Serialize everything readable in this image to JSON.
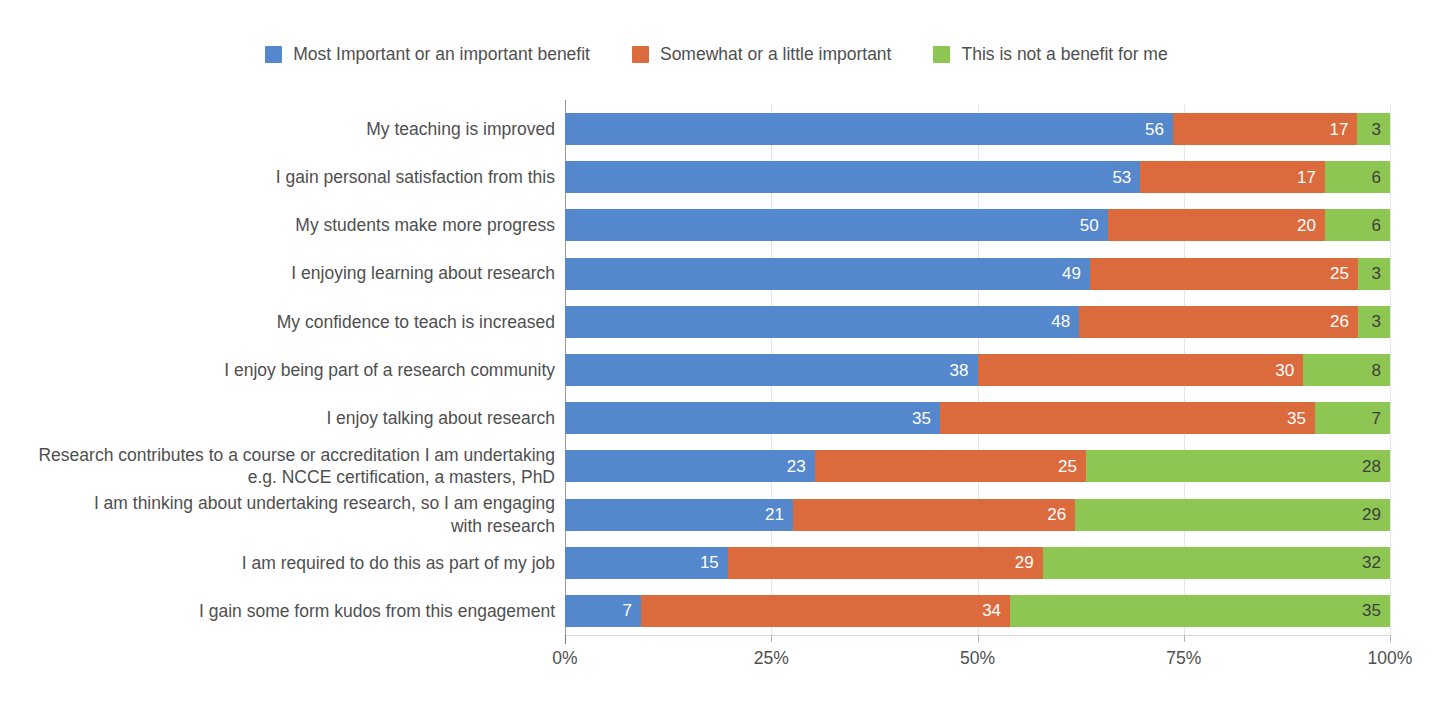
{
  "legend": {
    "position": "top-center",
    "items": [
      {
        "label": "Most Important or an important benefit",
        "color": "#5487CB",
        "key": "most_important"
      },
      {
        "label": "Somewhat or a little important",
        "color": "#DB6A3D",
        "key": "somewhat"
      },
      {
        "label": "This is not a benefit for me",
        "color": "#8DC653",
        "key": "not_a_benefit"
      }
    ]
  },
  "axis": {
    "x_tick_labels": [
      "0%",
      "25%",
      "50%",
      "75%",
      "100%"
    ],
    "x_tick_values": [
      0,
      25,
      50,
      75,
      100
    ],
    "x_axis_label": "",
    "y_axis_label": ""
  },
  "chart_data": {
    "type": "bar",
    "orientation": "horizontal",
    "stacked": true,
    "stack_normalized": true,
    "title": "",
    "subtitle": "",
    "xlabel": "",
    "ylabel": "",
    "xlim": [
      0,
      100
    ],
    "xticks": [
      0,
      25,
      50,
      75,
      100
    ],
    "xtick_labels": [
      "0%",
      "25%",
      "50%",
      "75%",
      "100%"
    ],
    "grid": "vertical-only",
    "legend_position": "top-center",
    "value_labels": true,
    "categories": [
      "My teaching is improved",
      "I gain personal satisfaction from this",
      "My students make more progress",
      "I enjoying learning about research",
      "My confidence to teach is increased",
      "I enjoy being part of a research community",
      "I enjoy talking about research",
      "Research contributes to a course or accreditation I am undertaking e.g. NCCE certification, a masters, PhD",
      "I am thinking about undertaking research, so I am engaging with research",
      "I am required to do this as part of my job",
      "I gain some form kudos from this engagement"
    ],
    "series": [
      {
        "name": "Most Important or an important benefit",
        "color": "#5487CB",
        "values": [
          56,
          53,
          50,
          49,
          48,
          38,
          35,
          23,
          21,
          15,
          7
        ]
      },
      {
        "name": "Somewhat or a little important",
        "color": "#DB6A3D",
        "values": [
          17,
          17,
          20,
          25,
          26,
          30,
          35,
          25,
          26,
          29,
          34
        ]
      },
      {
        "name": "This is not a benefit for me",
        "color": "#8DC653",
        "values": [
          3,
          6,
          6,
          3,
          3,
          8,
          7,
          28,
          29,
          32,
          35
        ]
      }
    ]
  },
  "rows": [
    {
      "label_lines": [
        "My teaching is improved"
      ],
      "values": [
        56,
        17,
        3
      ]
    },
    {
      "label_lines": [
        "I gain personal satisfaction from this"
      ],
      "values": [
        53,
        17,
        6
      ]
    },
    {
      "label_lines": [
        "My students make more progress"
      ],
      "values": [
        50,
        20,
        6
      ]
    },
    {
      "label_lines": [
        "I enjoying learning about research"
      ],
      "values": [
        49,
        25,
        3
      ]
    },
    {
      "label_lines": [
        "My confidence to teach is increased"
      ],
      "values": [
        48,
        26,
        3
      ]
    },
    {
      "label_lines": [
        "I enjoy being part of a research community"
      ],
      "values": [
        38,
        30,
        8
      ]
    },
    {
      "label_lines": [
        "I enjoy talking about research"
      ],
      "values": [
        35,
        35,
        7
      ]
    },
    {
      "label_lines": [
        "Research contributes to a course or accreditation I am undertaking",
        "e.g. NCCE certification, a masters, PhD"
      ],
      "values": [
        23,
        25,
        28
      ]
    },
    {
      "label_lines": [
        "I am thinking about undertaking research, so I am engaging",
        "with research"
      ],
      "values": [
        21,
        26,
        29
      ]
    },
    {
      "label_lines": [
        "I am required to do this as part of my job"
      ],
      "values": [
        15,
        29,
        32
      ]
    },
    {
      "label_lines": [
        "I gain some form kudos from this engagement"
      ],
      "values": [
        7,
        34,
        35
      ]
    }
  ],
  "colors": {
    "blue": "#5487CB",
    "orange": "#DB6A3D",
    "green": "#8DC653",
    "text": "#4f4f4f",
    "gridline": "#e6e6e6",
    "axis": "#8a8a8a",
    "background": "#ffffff"
  }
}
